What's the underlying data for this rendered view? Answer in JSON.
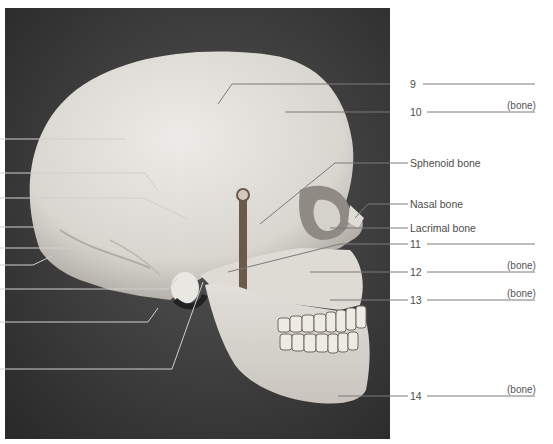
{
  "figure": {
    "photo_colors": {
      "background_dark": "#2f2f2f",
      "background_mid": "#4a4a4a",
      "bone_light": "#e6e4df",
      "bone_mid": "#cfccc6",
      "bone_shadow": "#9a968f",
      "leader_line": "#7a7a7a"
    }
  },
  "right_labels": [
    {
      "id": "9",
      "text": "9",
      "blank": true,
      "suffix": ""
    },
    {
      "id": "10",
      "text": "10",
      "blank": true,
      "suffix": "(bone)"
    },
    {
      "id": "sphenoid",
      "text": "Sphenoid bone",
      "blank": false,
      "suffix": ""
    },
    {
      "id": "nasal",
      "text": "Nasal bone",
      "blank": false,
      "suffix": ""
    },
    {
      "id": "lacrimal",
      "text": "Lacrimal bone",
      "blank": false,
      "suffix": ""
    },
    {
      "id": "11",
      "text": "11",
      "blank": true,
      "suffix": ""
    },
    {
      "id": "12",
      "text": "12",
      "blank": true,
      "suffix": "(bone)"
    },
    {
      "id": "13",
      "text": "13",
      "blank": true,
      "suffix": "(bone)"
    },
    {
      "id": "14",
      "text": "14",
      "blank": true,
      "suffix": "(bone)"
    }
  ],
  "left_leaders_count": 9
}
